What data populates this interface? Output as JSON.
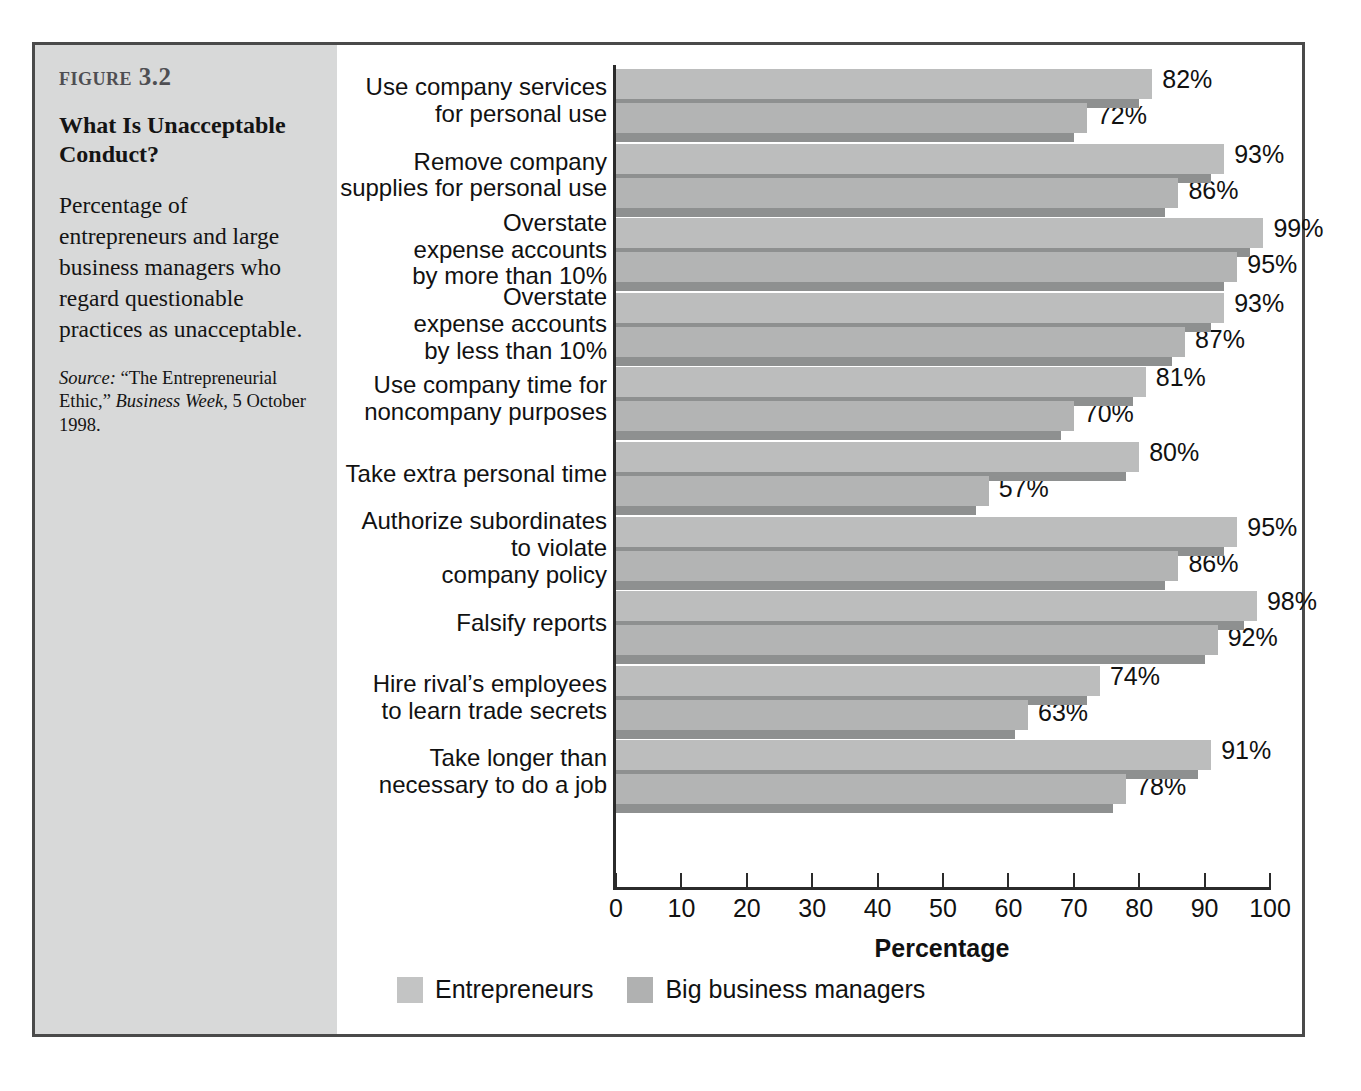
{
  "figure": {
    "number": "Figure 3.2",
    "title": "What Is Unacceptable Conduct?",
    "description": "Percentage of entrepreneurs and large business managers who regard questionable practices as unacceptable.",
    "source_label": "Source:",
    "source_text_1": "“The Entrepreneurial Ethic,”",
    "source_publication": "Business Week,",
    "source_text_2": "5 October 1998."
  },
  "chart_data": {
    "type": "bar",
    "orientation": "horizontal",
    "title": "What Is Unacceptable Conduct?",
    "xlabel": "Percentage",
    "ylabel": "",
    "xlim": [
      0,
      100
    ],
    "xticks": [
      0,
      10,
      20,
      30,
      40,
      50,
      60,
      70,
      80,
      90,
      100
    ],
    "xtick_labels": [
      "0",
      "10",
      "20",
      "30",
      "40",
      "50",
      "60",
      "70",
      "80",
      "90",
      "100"
    ],
    "grid": false,
    "legend_position": "bottom-left",
    "value_suffix": "%",
    "categories": [
      "Use company services for personal use",
      "Remove company supplies for personal use",
      "Overstate expense accounts by more than 10%",
      "Overstate expense accounts by less than 10%",
      "Use company time for noncompany purposes",
      "Take extra personal time",
      "Authorize subordinates to violate company policy",
      "Falsify reports",
      "Hire rival’s employees to learn trade secrets",
      "Take longer than necessary to do a job"
    ],
    "category_lines": [
      [
        "Use company services",
        "for personal use"
      ],
      [
        "Remove company",
        "supplies for personal use"
      ],
      [
        "Overstate",
        "expense accounts",
        "by more than 10%"
      ],
      [
        "Overstate",
        "expense accounts",
        "by less than 10%"
      ],
      [
        "Use company time for",
        "noncompany purposes"
      ],
      [
        "Take extra personal time"
      ],
      [
        "Authorize subordinates",
        "to violate",
        "company policy"
      ],
      [
        "Falsify reports"
      ],
      [
        "Hire rival’s employees",
        "to learn trade secrets"
      ],
      [
        "Take longer than",
        "necessary to do a job"
      ]
    ],
    "series": [
      {
        "name": "Entrepreneurs",
        "color": "#bcbdbd",
        "values": [
          82,
          93,
          99,
          93,
          81,
          80,
          95,
          98,
          74,
          91
        ],
        "value_labels": [
          "82%",
          "93%",
          "99%",
          "93%",
          "81%",
          "80%",
          "95%",
          "98%",
          "74%",
          "91%"
        ]
      },
      {
        "name": "Big business managers",
        "color": "#b3b4b4",
        "values": [
          72,
          86,
          95,
          87,
          70,
          57,
          86,
          92,
          63,
          78
        ],
        "value_labels": [
          "72%",
          "86%",
          "95%",
          "87%",
          "70%",
          "57%",
          "86%",
          "92%",
          "63%",
          "78%"
        ]
      }
    ]
  },
  "legend": {
    "items": [
      {
        "label": "Entrepreneurs",
        "color": "#c3c4c4"
      },
      {
        "label": "Big business managers",
        "color": "#b0b1b1"
      }
    ]
  }
}
